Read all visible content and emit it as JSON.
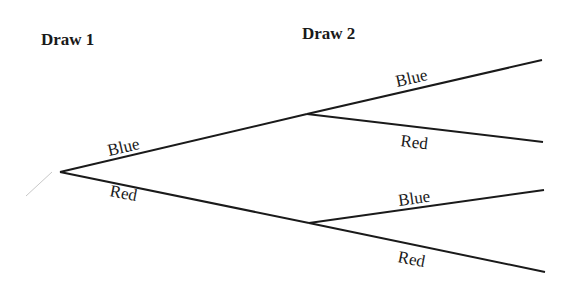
{
  "diagram": {
    "type": "probability-tree",
    "colors": {
      "line": "#1a1a1a",
      "text": "#1a1a1a",
      "background": "#ffffff",
      "stray_mark": "#c8c8c8"
    },
    "headings": {
      "draw1": "Draw 1",
      "draw2": "Draw 2"
    },
    "nodes": {
      "root": {
        "x": 60,
        "y": 172
      },
      "blue": {
        "x": 307,
        "y": 114
      },
      "red": {
        "x": 309,
        "y": 223
      }
    },
    "branches": {
      "first": [
        {
          "id": "blue",
          "label": "Blue",
          "from": "root",
          "to": "blue"
        },
        {
          "id": "red",
          "label": "Red",
          "from": "root",
          "to": "red"
        }
      ],
      "second": [
        {
          "id": "blue-blue",
          "label": "Blue",
          "from": "blue",
          "end": {
            "x": 542,
            "y": 60
          }
        },
        {
          "id": "blue-red",
          "label": "Red",
          "from": "blue",
          "end": {
            "x": 543,
            "y": 142
          }
        },
        {
          "id": "red-blue",
          "label": "Blue",
          "from": "red",
          "end": {
            "x": 544,
            "y": 190
          }
        },
        {
          "id": "red-red",
          "label": "Red",
          "from": "red",
          "end": {
            "x": 545,
            "y": 272
          }
        }
      ]
    }
  }
}
